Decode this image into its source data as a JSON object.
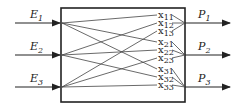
{
  "diagram": {
    "inputs": [
      {
        "symbol": "E",
        "sub": "1",
        "y": 23
      },
      {
        "symbol": "E",
        "sub": "2",
        "y": 55
      },
      {
        "symbol": "E",
        "sub": "3",
        "y": 87
      }
    ],
    "outputs": [
      {
        "symbol": "P",
        "sub": "1",
        "y": 23
      },
      {
        "symbol": "P",
        "sub": "2",
        "y": 55
      },
      {
        "symbol": "P",
        "sub": "3",
        "y": 87
      }
    ],
    "variables": [
      {
        "symbol": "x",
        "sub": "11",
        "y": 17
      },
      {
        "symbol": "x",
        "sub": "12",
        "y": 25
      },
      {
        "symbol": "x",
        "sub": "13",
        "y": 33
      },
      {
        "symbol": "x",
        "sub": "21",
        "y": 44
      },
      {
        "symbol": "x",
        "sub": "22",
        "y": 52
      },
      {
        "symbol": "x",
        "sub": "23",
        "y": 60
      },
      {
        "symbol": "x",
        "sub": "31",
        "y": 71
      },
      {
        "symbol": "x",
        "sub": "32",
        "y": 79
      },
      {
        "symbol": "x",
        "sub": "33",
        "y": 87
      }
    ],
    "colors": {
      "stroke": "#222222"
    }
  }
}
